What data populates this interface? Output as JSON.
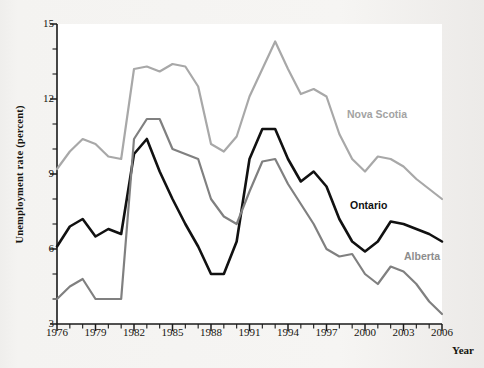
{
  "figure": {
    "background_color": "#f4f3f1",
    "plot_background_color": "#ffffff"
  },
  "axis": {
    "y_title": "Unemployment rate (percent)",
    "x_title": "Year",
    "y_ticks": [
      "15",
      "12",
      "9",
      "6",
      "3"
    ],
    "x_ticks": [
      "1976",
      "1979",
      "1982",
      "1985",
      "1988",
      "1991",
      "1994",
      "1997",
      "2000",
      "2003",
      "2006"
    ]
  },
  "labels": {
    "nova_scotia": "Nova Scotia",
    "ontario": "Ontario",
    "alberta": "Alberta"
  },
  "colors": {
    "nova_scotia": "#a8a8a8",
    "ontario": "#111111",
    "alberta": "#808080",
    "axis": "#1a1a1a",
    "text": "#17150f"
  },
  "chart_data": {
    "type": "line",
    "title": "",
    "xlabel": "Year",
    "ylabel": "Unemployment rate (percent)",
    "xlim": [
      1976,
      2006
    ],
    "ylim": [
      3,
      15
    ],
    "y_major_ticks": [
      3,
      6,
      9,
      12,
      15
    ],
    "y_minor_tick_step": 1,
    "x_major_ticks": [
      1976,
      1979,
      1982,
      1985,
      1988,
      1991,
      1994,
      1997,
      2000,
      2003,
      2006
    ],
    "x_minor_tick_step": 1,
    "grid": false,
    "legend": "inline-annotations",
    "x": [
      1976,
      1977,
      1978,
      1979,
      1980,
      1981,
      1982,
      1983,
      1984,
      1985,
      1986,
      1987,
      1988,
      1989,
      1990,
      1991,
      1992,
      1993,
      1994,
      1995,
      1996,
      1997,
      1998,
      1999,
      2000,
      2001,
      2002,
      2003,
      2004,
      2005,
      2006
    ],
    "series": [
      {
        "name": "Nova Scotia",
        "color": "#a8a8a8",
        "values": [
          9.2,
          9.9,
          10.4,
          10.2,
          9.7,
          9.6,
          13.2,
          13.3,
          13.1,
          13.4,
          13.3,
          12.5,
          10.2,
          9.9,
          10.5,
          12.1,
          13.2,
          14.3,
          13.2,
          12.2,
          12.4,
          12.1,
          10.6,
          9.6,
          9.1,
          9.7,
          9.6,
          9.3,
          8.8,
          8.4,
          8.0
        ]
      },
      {
        "name": "Ontario",
        "color": "#111111",
        "values": [
          6.1,
          6.9,
          7.2,
          6.5,
          6.8,
          6.6,
          9.8,
          10.4,
          9.1,
          8.0,
          7.0,
          6.1,
          5.0,
          5.0,
          6.3,
          9.6,
          10.8,
          10.8,
          9.6,
          8.7,
          9.1,
          8.5,
          7.2,
          6.3,
          5.9,
          6.3,
          7.1,
          7.0,
          6.8,
          6.6,
          6.3
        ]
      },
      {
        "name": "Alberta",
        "color": "#808080",
        "values": [
          4.0,
          4.5,
          4.8,
          4.0,
          4.0,
          4.0,
          10.4,
          11.2,
          11.2,
          10.0,
          9.8,
          9.6,
          8.0,
          7.3,
          7.0,
          8.3,
          9.5,
          9.6,
          8.6,
          7.8,
          7.0,
          6.0,
          5.7,
          5.8,
          5.0,
          4.6,
          5.3,
          5.1,
          4.6,
          3.9,
          3.4
        ]
      }
    ]
  }
}
